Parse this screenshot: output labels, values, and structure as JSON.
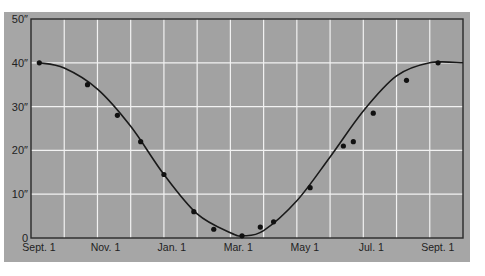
{
  "chart_data": {
    "type": "line",
    "title": "",
    "xlabel": "",
    "ylabel": "",
    "ylim": [
      0,
      50
    ],
    "xlim_months": [
      0,
      12
    ],
    "grid": true,
    "legend": null,
    "y_ticks": [
      "0",
      "10″",
      "20″",
      "30″",
      "40″",
      "50″"
    ],
    "y_tick_values": [
      0,
      10,
      20,
      30,
      40,
      50
    ],
    "x_ticks": [
      "Sept. 1",
      "Nov. 1",
      "Jan. 1",
      "Mar. 1",
      "May 1",
      "Jul. 1",
      "Sept. 1"
    ],
    "x_tick_months": [
      0,
      2,
      4,
      6,
      8,
      10,
      12
    ],
    "series": [
      {
        "name": "observed points",
        "kind": "scatter",
        "x_months": [
          0.25,
          1.7,
          2.6,
          3.3,
          4.0,
          4.9,
          5.5,
          6.35,
          6.9,
          7.3,
          8.4,
          9.4,
          9.7,
          10.3,
          11.3,
          12.25
        ],
        "values": [
          40,
          35,
          28,
          22,
          14.5,
          6,
          2,
          0.5,
          2.5,
          3.7,
          11.5,
          21,
          22,
          28.5,
          36,
          40
        ]
      },
      {
        "name": "fitted curve",
        "kind": "line",
        "x_months": [
          0.25,
          1,
          2,
          3,
          4,
          5,
          6,
          6.4,
          7,
          8,
          9,
          10,
          11,
          12,
          13
        ],
        "values": [
          40,
          38.8,
          34,
          25.5,
          14.5,
          5.5,
          1.2,
          0.5,
          1.7,
          8.5,
          18.5,
          29,
          37,
          40,
          40
        ]
      }
    ]
  }
}
